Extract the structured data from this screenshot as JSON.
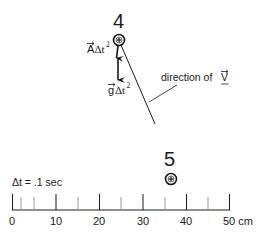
{
  "particles": [
    {
      "label": "4",
      "x": 119,
      "y": 40
    },
    {
      "label": "5",
      "x": 171,
      "y": 178
    }
  ],
  "vectors": {
    "acceleration": {
      "label_main": "A",
      "label_suffix": "Δt",
      "exponent": "2"
    },
    "gravity": {
      "label_main": "g",
      "label_suffix": "Δt",
      "exponent": "2"
    },
    "velocity": {
      "label_prefix": "direction of ",
      "label_vec": "V"
    }
  },
  "timestep": {
    "label": "Δt = .1 sec"
  },
  "ruler": {
    "unit": "cm",
    "ticks": [
      0,
      5,
      10,
      15,
      20,
      25,
      30,
      35,
      40,
      45,
      50
    ],
    "major_labels": [
      "0",
      "10",
      "20",
      "30",
      "40",
      "50 cm"
    ],
    "minor_extra_tick": 2
  },
  "colors": {
    "ink": "#1a1a1a",
    "gray_tick": "#9a9a9a",
    "background": "#ffffff"
  }
}
